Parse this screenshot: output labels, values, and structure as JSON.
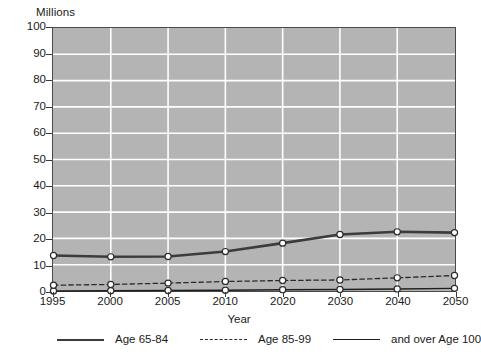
{
  "chart_data": {
    "type": "line",
    "title": "",
    "ylabel": "Millions",
    "xlabel": "Year",
    "categories": [
      "1995",
      "2000",
      "2005",
      "2010",
      "2020",
      "2030",
      "2040",
      "2050"
    ],
    "ylim": [
      0,
      100
    ],
    "ytick_labels": [
      "0",
      "10",
      "20",
      "30",
      "40",
      "50",
      "60",
      "70",
      "80",
      "90",
      "100"
    ],
    "ytick_values": [
      0,
      10,
      20,
      30,
      40,
      50,
      60,
      70,
      80,
      90,
      100
    ],
    "grid": true,
    "grid_color": "#ffffff",
    "plot_background": "#b4b4b4",
    "legend_position": "bottom",
    "series": [
      {
        "name": "Age 65-84",
        "style": "solid-thick",
        "color": "#3c3c3c",
        "marker": "open-circle",
        "values": [
          13.5,
          13.0,
          13.1,
          15.0,
          18.2,
          21.5,
          22.5,
          22.2
        ]
      },
      {
        "name": "Age 85-99",
        "style": "dashed",
        "color": "#2a2a2a",
        "marker": "open-circle",
        "values": [
          2.2,
          2.5,
          3.0,
          3.6,
          4.0,
          4.2,
          5.0,
          5.9
        ]
      },
      {
        "name": "and over Age 100",
        "style": "solid-thin",
        "color": "#1f1f1f",
        "marker": "open-circle",
        "values": [
          0.0,
          0.1,
          0.2,
          0.3,
          0.5,
          0.6,
          0.8,
          1.0
        ]
      }
    ]
  },
  "legend": {
    "items": [
      {
        "label": "Age 65-84"
      },
      {
        "label": "Age 85-99"
      },
      {
        "label": "and over Age 100"
      }
    ]
  }
}
